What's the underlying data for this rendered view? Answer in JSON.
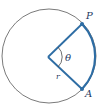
{
  "diagram": {
    "type": "circle-sector",
    "circle": {
      "cx": 49,
      "cy": 56,
      "r": 47,
      "stroke": "#6b6b6b"
    },
    "center": {
      "x": 48,
      "y": 57
    },
    "points": {
      "P": {
        "label": "P",
        "x": 82,
        "y": 24
      },
      "A": {
        "label": "A",
        "x": 82,
        "y": 89
      }
    },
    "labels": {
      "angle": "θ",
      "radius": "r",
      "point_p": "P",
      "point_a": "A"
    },
    "colors": {
      "accent": "#2e6da4",
      "circle": "#6b6b6b",
      "label": "#1e3a5f"
    }
  }
}
